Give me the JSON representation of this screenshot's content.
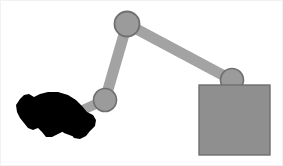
{
  "scene": {
    "title": "robot-arm-simulation",
    "width": 283,
    "height": 166,
    "background_color": "#ffffff",
    "border_color": "#f2f2f2"
  },
  "colors": {
    "link_fill": "#a3a3a3",
    "link_stroke": "#8f8f8f",
    "joint_fill": "#9b9b9b",
    "joint_stroke": "#6f6f6f",
    "box_fill": "#8f8f8f",
    "box_stroke": "#6e6e6e",
    "obstacle_fill": "#000000",
    "shadow_fill": "#b5b5b5"
  },
  "robot_arm": {
    "label": "two-link-planar-arm",
    "links": [
      {
        "name": "upper-link",
        "x1": 127,
        "y1": 24,
        "x2": 232,
        "y2": 80,
        "thickness": 11
      },
      {
        "name": "fore-link",
        "x1": 127,
        "y1": 24,
        "x2": 105,
        "y2": 100,
        "thickness": 11
      },
      {
        "name": "gripper-link",
        "x1": 105,
        "y1": 100,
        "x2": 42,
        "y2": 128,
        "thickness": 10
      }
    ],
    "joints": [
      {
        "name": "elbow-joint",
        "cx": 127,
        "cy": 24,
        "r": 12.5
      },
      {
        "name": "wrist-joint",
        "cx": 105,
        "cy": 100,
        "r": 11.5
      },
      {
        "name": "base-joint",
        "cx": 232,
        "cy": 80,
        "r": 11.5
      }
    ]
  },
  "objects": {
    "box": {
      "name": "grasp-target-box",
      "x": 199,
      "y": 85,
      "width": 71,
      "height": 70
    },
    "obstacle": {
      "name": "black-obstacle-blob",
      "points": "20,99 24,95 29,94 34,97 40,94 48,92 58,92 68,95 76,100 82,106 87,112 93,115 96,120 95,126 90,131 86,136 80,139 74,138 70,133 64,131 58,134 52,137 46,137 42,132 38,128 33,130 28,128 24,123 20,118 17,112 16,105"
    },
    "obstacle_shadow": {
      "name": "obstacle-shadow",
      "points": "39,122 52,117 66,113 78,114 86,119 88,126 80,130 68,130 56,133 46,134 40,130"
    }
  }
}
